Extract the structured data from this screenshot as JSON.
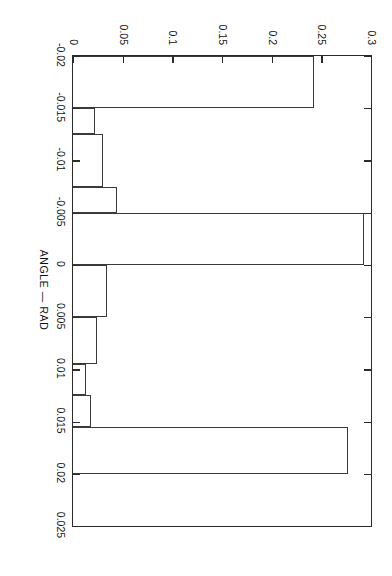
{
  "chart_data": {
    "type": "bar",
    "title": "BLINK",
    "xlabel": "ANGLE  —  RAD",
    "ylabel": "",
    "xlim": [
      -0.02,
      0.025
    ],
    "ylim": [
      0,
      0.3
    ],
    "grid": false,
    "legend": false,
    "orientation": "page-rotated-90",
    "xticks": [
      -0.02,
      -0.015,
      -0.01,
      -0.005,
      0,
      0.005,
      0.01,
      0.015,
      0.02,
      0.025
    ],
    "xticklabels": [
      "-0.02",
      "-0.015",
      "-0.01",
      "-0.005",
      "0",
      "0.005",
      "0.01",
      "0.015",
      "0.02",
      "0.025"
    ],
    "yticks": [
      0,
      0.05,
      0.1,
      0.15,
      0.2,
      0.25,
      0.3
    ],
    "yticklabels": [
      "0",
      "0.05",
      "0.1",
      "0.15",
      "0.2",
      "0.25",
      "0.3"
    ],
    "bin_width": 0.0025,
    "bars": [
      {
        "left": -0.02,
        "right": -0.015,
        "value": 0.243
      },
      {
        "left": -0.015,
        "right": -0.0125,
        "value": 0.022
      },
      {
        "left": -0.0125,
        "right": -0.0075,
        "value": 0.03
      },
      {
        "left": -0.0075,
        "right": -0.005,
        "value": 0.044
      },
      {
        "left": -0.005,
        "right": 0.0,
        "value": 0.293
      },
      {
        "left": 0.0,
        "right": 0.005,
        "value": 0.034
      },
      {
        "left": 0.005,
        "right": 0.0095,
        "value": 0.024
      },
      {
        "left": 0.0095,
        "right": 0.0125,
        "value": 0.013
      },
      {
        "left": 0.0125,
        "right": 0.0155,
        "value": 0.018
      },
      {
        "left": 0.0155,
        "right": 0.02,
        "value": 0.277
      }
    ],
    "categories": [
      "-0.0175",
      "-0.01375",
      "-0.01",
      "-0.00625",
      "-0.0025",
      "0.0025",
      "0.00725",
      "0.011",
      "0.014",
      "0.01775"
    ],
    "values": [
      0.243,
      0.022,
      0.03,
      0.044,
      0.293,
      0.034,
      0.024,
      0.013,
      0.018,
      0.277
    ]
  }
}
